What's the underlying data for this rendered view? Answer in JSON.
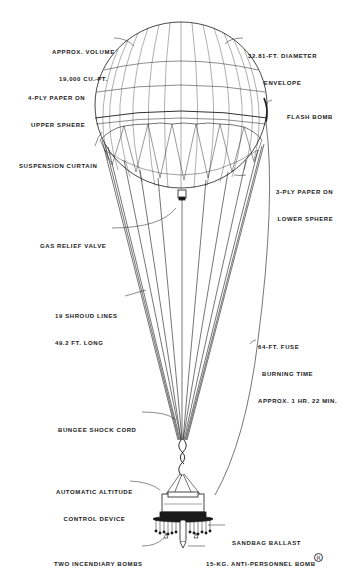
{
  "diagram": {
    "colors": {
      "ink": "#1a1a1a",
      "background": "#ffffff"
    },
    "labels": {
      "volume": {
        "line1": "APPROX. VOLUME",
        "line2": "19,000 CU. FT."
      },
      "diameter": {
        "line1": "32.81-FT. DIAMETER",
        "line2": "ENVELOPE"
      },
      "upper_sphere": {
        "line1": "4-PLY PAPER ON",
        "line2": "UPPER SPHERE"
      },
      "flash_bomb": {
        "line1": "FLASH BOMB"
      },
      "suspension_curtain": {
        "line1": "SUSPENSION CURTAIN"
      },
      "lower_sphere": {
        "line1": "3-PLY PAPER ON",
        "line2": "LOWER SPHERE"
      },
      "gas_relief_valve": {
        "line1": "GAS RELIEF VALVE"
      },
      "shroud_lines": {
        "line1": "19 SHROUD LINES",
        "line2": "49.2 FT. LONG"
      },
      "fuse": {
        "line1": "64-FT. FUSE",
        "line2": "BURNING TIME",
        "line3": "APPROX. 1 HR. 22 MIN."
      },
      "bungee": {
        "line1": "BUNGEE SHOCK CORD"
      },
      "altitude_control": {
        "line1": "AUTOMATIC ALTITUDE",
        "line2": "CONTROL DEVICE"
      },
      "sandbag": {
        "line1": "SANDBAG BALLAST"
      },
      "incendiary": {
        "line1": "TWO INCENDIARY BOMBS"
      },
      "anti_personnel": {
        "line1": "15-KG. ANTI-PERSONNEL BOMB"
      }
    },
    "corner_mark": "R"
  }
}
